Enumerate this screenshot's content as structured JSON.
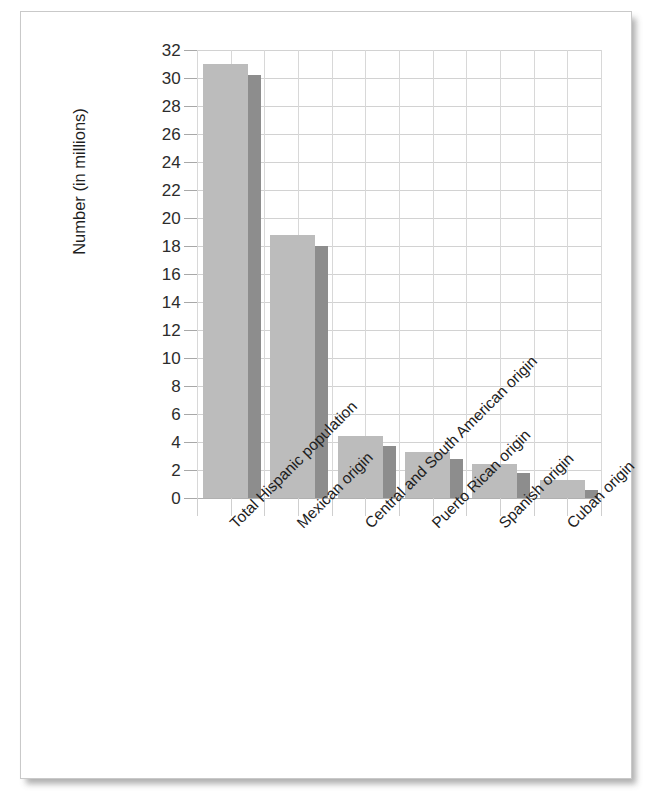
{
  "chart_data": {
    "type": "bar",
    "title": "",
    "subtitle": "",
    "xlabel": "",
    "ylabel": "Number (in millions)",
    "ylim": [
      0,
      32
    ],
    "ytick_step": 2,
    "ytick_labels": [
      "32",
      "30",
      "28",
      "26",
      "24",
      "22",
      "20",
      "18",
      "16",
      "14",
      "12",
      "10",
      "8",
      "6",
      "4",
      "2",
      "0"
    ],
    "grid": true,
    "legend": "none",
    "categories": [
      "Total Hispanic population",
      "Mexican origin",
      "Central and South American origin",
      "Puerto Rican origin",
      "Spanish origin",
      "Cuban origin"
    ],
    "series": [
      {
        "name": "light-bar",
        "color": "#bcbcbc",
        "values": [
          31.0,
          18.8,
          4.4,
          3.3,
          2.4,
          1.3
        ]
      },
      {
        "name": "dark-bar",
        "color": "#8d8d8d",
        "values": [
          30.2,
          18.0,
          3.7,
          2.8,
          1.8,
          0.6
        ]
      }
    ]
  },
  "chart": {
    "axis_title": "Number (in millions)",
    "colors": {
      "bar_light": "#bcbcbc",
      "bar_dark": "#8d8d8d",
      "gridline": "#d2d2d2",
      "axis": "#b0b0b0",
      "text": "#1d1d1d",
      "page": "#ffffff",
      "frame": "#c9c9c9"
    }
  }
}
